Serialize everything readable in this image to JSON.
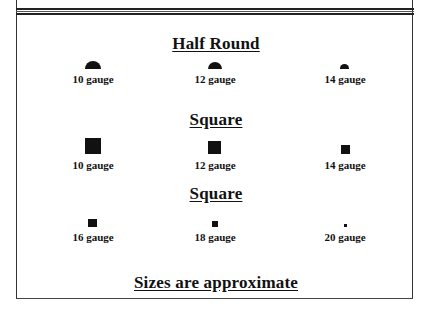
{
  "sections": [
    {
      "title": "Half Round",
      "shape": "half-round",
      "items": [
        {
          "label": "10 gauge",
          "width": 16,
          "height": 8
        },
        {
          "label": "12 gauge",
          "width": 14,
          "height": 7
        },
        {
          "label": "14 gauge",
          "width": 9,
          "height": 5
        }
      ]
    },
    {
      "title": "Square",
      "shape": "square",
      "items": [
        {
          "label": "10 gauge",
          "size": 16
        },
        {
          "label": "12 gauge",
          "size": 13
        },
        {
          "label": "14 gauge",
          "size": 9
        }
      ]
    },
    {
      "title": "Square",
      "shape": "square",
      "items": [
        {
          "label": "16 gauge",
          "size": 9
        },
        {
          "label": "18 gauge",
          "size": 6
        },
        {
          "label": "20 gauge",
          "size": 3
        }
      ]
    }
  ],
  "footer": {
    "note": "Sizes are approximate"
  },
  "colors": {
    "ink": "#111111",
    "background": "#ffffff"
  }
}
